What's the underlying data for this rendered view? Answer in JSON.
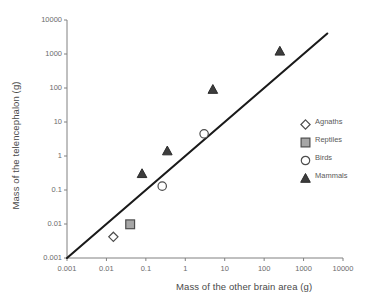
{
  "chart_data": {
    "type": "scatter",
    "title": "",
    "xlabel": "Mass of the other brain area (g)",
    "ylabel": "Mass of the telencephalon (g)",
    "xscale": "log",
    "yscale": "log",
    "xlim": [
      0.001,
      10000
    ],
    "ylim": [
      0.001,
      10000
    ],
    "grid": false,
    "legend_position": "right",
    "xticks": [
      "0.001",
      "0.01",
      "0.1",
      "1",
      "10",
      "100",
      "1000",
      "10000"
    ],
    "xtick_values": [
      0.001,
      0.01,
      0.1,
      1,
      10,
      100,
      1000,
      10000
    ],
    "yticks": [
      "0.001",
      "0.01",
      "0.1",
      "1",
      "10",
      "100",
      "1000",
      "10000"
    ],
    "ytick_values": [
      0.001,
      0.01,
      0.1,
      1,
      10,
      100,
      1000,
      10000
    ],
    "series": [
      {
        "name": "Agnaths",
        "marker": "open-diamond",
        "color": "#ffffff",
        "edge_color": "#4d4d4d",
        "points": [
          {
            "x": 0.015,
            "y": 0.0042
          }
        ]
      },
      {
        "name": "Reptiles",
        "marker": "filled-square",
        "color": "#a6a6a6",
        "edge_color": "#4d4d4d",
        "points": [
          {
            "x": 0.04,
            "y": 0.0098
          }
        ]
      },
      {
        "name": "Birds",
        "marker": "open-circle",
        "color": "#ffffff",
        "edge_color": "#4d4d4d",
        "points": [
          {
            "x": 0.26,
            "y": 0.13
          },
          {
            "x": 3.0,
            "y": 4.5
          }
        ]
      },
      {
        "name": "Mammals",
        "marker": "filled-triangle",
        "color": "#3d3d3d",
        "edge_color": "#2b2b2b",
        "points": [
          {
            "x": 0.08,
            "y": 0.3
          },
          {
            "x": 0.35,
            "y": 1.4
          },
          {
            "x": 5.0,
            "y": 90
          },
          {
            "x": 250,
            "y": 1200
          }
        ]
      }
    ],
    "reference_line": {
      "name": "identity-line",
      "slope": 1,
      "color": "#1a1a1a",
      "from": {
        "x": 0.001,
        "y": 0.001
      },
      "to": {
        "x": 4000,
        "y": 4000
      }
    }
  },
  "legend": {
    "items": [
      {
        "label": "Agnaths"
      },
      {
        "label": "Reptiles"
      },
      {
        "label": "Birds"
      },
      {
        "label": "Mammals"
      }
    ]
  },
  "axes": {
    "x_title": "Mass of the other brain area (g)",
    "y_title": "Mass of the telencephalon (g)"
  }
}
